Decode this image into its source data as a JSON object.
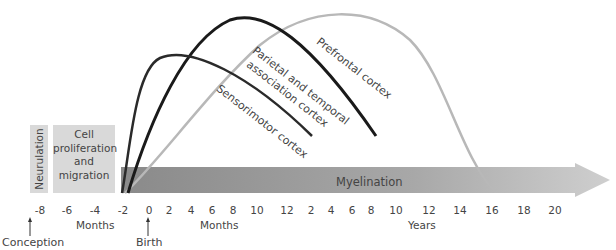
{
  "stages": {
    "neurulation": "Neurulation",
    "cell_proliferation": [
      "Cell",
      "proliferation",
      "and",
      "migration"
    ],
    "myelination": "Myelination"
  },
  "curves": {
    "sensorimotor": {
      "label": "Sensorimotor cortex",
      "color": "#333333"
    },
    "parietal_temporal": {
      "label_line1": "Parietal and temporal",
      "label_line2": "association cortex",
      "color": "#1a1a1a"
    },
    "prefrontal": {
      "label": "Prefrontal cortex",
      "color": "#b0b0b0"
    }
  },
  "axis": {
    "prenatal_ticks": [
      "-8",
      "-6",
      "-4",
      "-2",
      "0"
    ],
    "month_ticks": [
      "2",
      "4",
      "6",
      "8",
      "10",
      "12",
      "2",
      "4",
      "6",
      "8"
    ],
    "year_ticks": [
      "10",
      "12",
      "14",
      "16",
      "18",
      "20"
    ],
    "unit_months_prenatal": "Months",
    "unit_months_postnatal": "Months",
    "unit_years": "Years",
    "conception": "Conception",
    "birth": "Birth"
  },
  "colors": {
    "stage_box": "#d9d9d9",
    "arrow_dark": "#8c8c8c",
    "arrow_light": "#c8c8c8"
  }
}
